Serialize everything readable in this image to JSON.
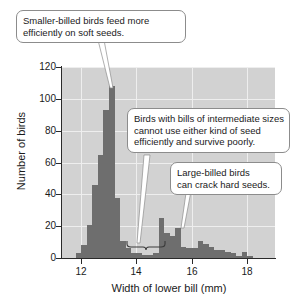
{
  "chart_data": {
    "type": "bar",
    "title": "",
    "subtitle": "",
    "xlabel": "Width of lower bill (mm)",
    "ylabel": "Number of birds",
    "xlim": [
      11.3,
      19.0
    ],
    "ylim": [
      0,
      120
    ],
    "xticks": [
      12,
      14,
      16,
      18
    ],
    "yticks": [
      0,
      20,
      40,
      60,
      80,
      100,
      120
    ],
    "grid": true,
    "legend_position": "none",
    "bin_width": 0.2,
    "bar_color": "#6e6e6e",
    "plot_background": "#d2d2d2",
    "gridline_color": "#eeeeee",
    "x": [
      11.9,
      12.1,
      12.3,
      12.5,
      12.7,
      12.9,
      13.1,
      13.3,
      13.5,
      13.7,
      13.9,
      14.1,
      14.3,
      14.5,
      14.7,
      14.9,
      15.1,
      15.3,
      15.5,
      15.7,
      15.9,
      16.1,
      16.3,
      16.5,
      16.7,
      16.9,
      17.1,
      17.3,
      17.5,
      17.7,
      17.9,
      18.1
    ],
    "values": [
      3,
      8,
      21,
      46,
      65,
      93,
      108,
      38,
      11,
      6,
      3,
      3,
      2,
      2,
      3,
      25,
      16,
      14,
      19,
      7,
      6,
      6,
      11,
      9,
      7,
      5,
      5,
      4,
      3,
      1,
      4,
      1
    ],
    "annotations": [
      {
        "id": "smaller-billed",
        "text": "Smaller-billed birds feed more efficiently on soft seeds.",
        "lines": [
          "Smaller-billed birds feed more",
          "efficiently on soft seeds."
        ],
        "points_to_x": 12.9,
        "points_to_y": 110
      },
      {
        "id": "intermediate",
        "text": "Birds with bills of intermediate sizes cannot use either kind of seed efficiently and survive poorly.",
        "lines": [
          "Birds with bills of intermediate sizes",
          "cannot use either kind of seed",
          "efficiently and survive poorly."
        ],
        "points_to_x": 14.3,
        "points_to_y": 8
      },
      {
        "id": "large-billed",
        "text": "Large-billed birds can crack hard seeds.",
        "lines": [
          "Large-billed birds",
          "can crack hard seeds."
        ],
        "points_to_x": 15.7,
        "points_to_y": 19
      }
    ],
    "brace": {
      "present": true,
      "x_range": [
        13.7,
        14.9
      ],
      "label": "intermediate-size-range-brace"
    }
  },
  "ytick_labels": [
    "0",
    "20",
    "40",
    "60",
    "80",
    "100",
    "120"
  ],
  "xtick_labels": [
    "12",
    "14",
    "16",
    "18"
  ]
}
